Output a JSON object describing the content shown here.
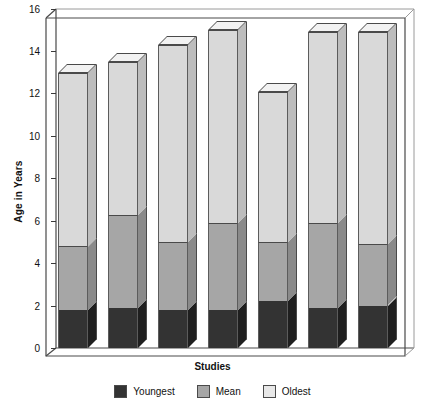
{
  "chart_data": {
    "type": "bar",
    "subtype": "stacked-3d-column",
    "title": "",
    "xlabel": "Studies",
    "ylabel": "Age in Years",
    "ylim": [
      0,
      16
    ],
    "yticks": [
      0,
      2,
      4,
      6,
      8,
      10,
      12,
      14,
      16
    ],
    "ytick_labels": [
      "0",
      "2",
      "4",
      "6",
      "8",
      "10",
      "12",
      "14",
      "16"
    ],
    "grid": false,
    "legend_position": "bottom",
    "categories": [
      "1",
      "2",
      "3",
      "4",
      "5",
      "6",
      "7"
    ],
    "series": [
      {
        "name": "Youngest",
        "color": "#333333",
        "values": [
          1.8,
          1.9,
          1.8,
          1.8,
          2.2,
          1.9,
          2.0
        ]
      },
      {
        "name": "Mean",
        "color": "#a6a6a6",
        "values": [
          4.8,
          6.3,
          5.0,
          5.9,
          5.0,
          5.9,
          4.9
        ]
      },
      {
        "name": "Oldest",
        "color": "#e8e8e8",
        "values": [
          13.0,
          13.5,
          14.3,
          15.0,
          12.1,
          14.9,
          14.9
        ]
      }
    ],
    "note": "Mean and Oldest values are cumulative stack tops read off the y-axis."
  },
  "axes": {
    "y_title": "Age in Years",
    "x_title": "Studies",
    "ticks": [
      {
        "label": "16"
      },
      {
        "label": "14"
      },
      {
        "label": "12"
      },
      {
        "label": "10"
      },
      {
        "label": "8"
      },
      {
        "label": "6"
      },
      {
        "label": "4"
      },
      {
        "label": "2"
      },
      {
        "label": "0"
      }
    ]
  },
  "legend": {
    "items": [
      {
        "label": "Youngest"
      },
      {
        "label": "Mean"
      },
      {
        "label": "Oldest"
      }
    ]
  }
}
